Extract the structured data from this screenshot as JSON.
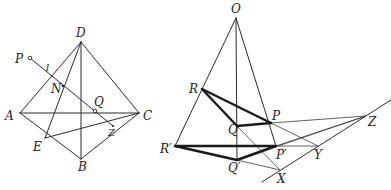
{
  "figure_left": {
    "title": "Tetrahedron ABCD with line l",
    "labels": {
      "D": "D",
      "A": "A",
      "B": "B",
      "C": "C",
      "E": "E",
      "Z": "Z",
      "N": "N",
      "Q": "Q",
      "P": "P",
      "l": "l"
    }
  },
  "figure_right": {
    "title": "Desargues configuration with center O",
    "labels": {
      "O": "O",
      "R": "R",
      "R_prime": "R′",
      "Q": "Q",
      "Q_prime": "Q′",
      "P": "P",
      "P_prime": "P′",
      "Z": "Z",
      "Y": "Y",
      "X": "X"
    }
  },
  "colors": {
    "line": "#2a2a2a",
    "background": "#ffffff"
  }
}
